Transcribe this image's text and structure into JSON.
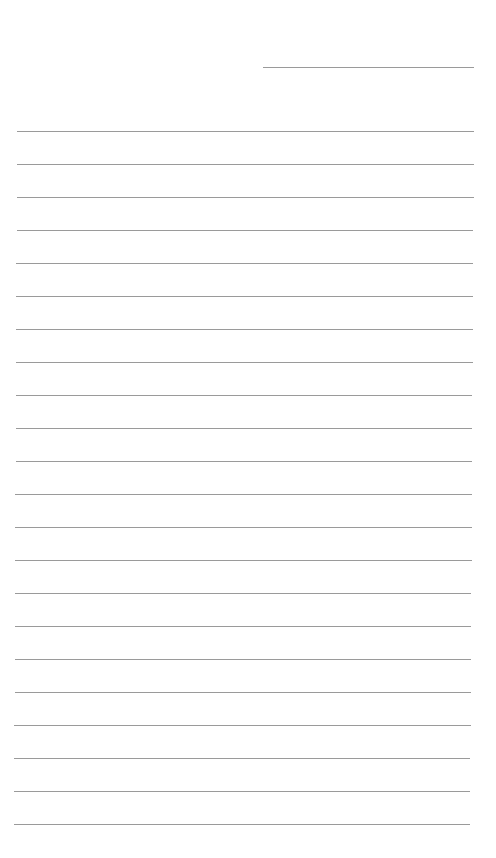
{
  "page": {
    "type": "lined-paper",
    "background_color": "#ffffff",
    "line_color": "#9a9a9a",
    "header_line": {
      "x_start": 263,
      "x_end": 474,
      "y": 67
    },
    "ruled_lines": {
      "count": 22,
      "first_y": 131,
      "spacing": 33,
      "x_start_top": 17,
      "x_end_top": 474,
      "x_start_bottom": 14,
      "x_end_bottom": 470
    }
  }
}
